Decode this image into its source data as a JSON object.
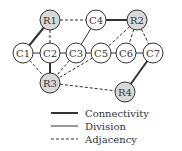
{
  "diagram": {
    "nodes": [
      {
        "id": "R1",
        "label": "R1",
        "x": 50,
        "y": 20,
        "shaded": true
      },
      {
        "id": "C4",
        "label": "C4",
        "x": 96,
        "y": 20,
        "shaded": false
      },
      {
        "id": "R2",
        "label": "R2",
        "x": 137,
        "y": 20,
        "shaded": true
      },
      {
        "id": "C1",
        "label": "C1",
        "x": 23,
        "y": 53,
        "shaded": false
      },
      {
        "id": "C2",
        "label": "C2",
        "x": 50,
        "y": 53,
        "shaded": false
      },
      {
        "id": "C3",
        "label": "C3",
        "x": 76,
        "y": 53,
        "shaded": false
      },
      {
        "id": "C5",
        "label": "C5",
        "x": 101,
        "y": 53,
        "shaded": false
      },
      {
        "id": "C6",
        "label": "C6",
        "x": 126,
        "y": 53,
        "shaded": false
      },
      {
        "id": "C7",
        "label": "C7",
        "x": 153,
        "y": 53,
        "shaded": false
      },
      {
        "id": "R3",
        "label": "R3",
        "x": 50,
        "y": 83,
        "shaded": true
      },
      {
        "id": "R4",
        "label": "R4",
        "x": 125,
        "y": 92,
        "shaded": true
      }
    ],
    "edges": [
      {
        "from": "R1",
        "to": "C4",
        "type": "adjacency"
      },
      {
        "from": "C4",
        "to": "R2",
        "type": "connectivity"
      },
      {
        "from": "R1",
        "to": "C1",
        "type": "connectivity"
      },
      {
        "from": "R1",
        "to": "C2",
        "type": "adjacency"
      },
      {
        "from": "C4",
        "to": "C3",
        "type": "division"
      },
      {
        "from": "R2",
        "to": "C5",
        "type": "adjacency"
      },
      {
        "from": "R2",
        "to": "C6",
        "type": "adjacency"
      },
      {
        "from": "R2",
        "to": "C7",
        "type": "adjacency"
      },
      {
        "from": "C1",
        "to": "C2",
        "type": "division"
      },
      {
        "from": "C2",
        "to": "C3",
        "type": "division"
      },
      {
        "from": "C3",
        "to": "C5",
        "type": "division"
      },
      {
        "from": "C5",
        "to": "C6",
        "type": "division"
      },
      {
        "from": "C6",
        "to": "C7",
        "type": "division"
      },
      {
        "from": "C1",
        "to": "R3",
        "type": "adjacency"
      },
      {
        "from": "C2",
        "to": "R3",
        "type": "connectivity"
      },
      {
        "from": "C3",
        "to": "R3",
        "type": "adjacency"
      },
      {
        "from": "C5",
        "to": "R3",
        "type": "adjacency"
      },
      {
        "from": "R3",
        "to": "R4",
        "type": "adjacency"
      },
      {
        "from": "C7",
        "to": "R4",
        "type": "connectivity"
      }
    ],
    "legend": {
      "items": [
        {
          "type": "connectivity",
          "label": "Connectivity"
        },
        {
          "type": "division",
          "label": "Division"
        },
        {
          "type": "adjacency",
          "label": "Adjacency"
        }
      ]
    },
    "colors": {
      "stroke": "#333333",
      "shaded_fill": "#d9d9d9",
      "plain_fill": "#ffffff"
    }
  }
}
